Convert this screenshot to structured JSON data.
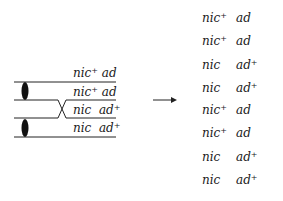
{
  "diagram": {
    "left": {
      "chromatids": [
        {
          "nic": "nic",
          "nic_sup": "+",
          "ad": "ad",
          "ad_sup": ""
        },
        {
          "nic": "nic",
          "nic_sup": "+",
          "ad": "ad",
          "ad_sup": ""
        },
        {
          "nic": "nic",
          "nic_sup": "",
          "ad": "ad",
          "ad_sup": "+"
        },
        {
          "nic": "nic",
          "nic_sup": "",
          "ad": "ad",
          "ad_sup": "+"
        }
      ],
      "crossover": "between chromatid 2 and 3"
    },
    "arrow": "right-arrow",
    "right": {
      "products": [
        {
          "nic": "nic",
          "nic_sup": "+",
          "ad": "ad",
          "ad_sup": ""
        },
        {
          "nic": "nic",
          "nic_sup": "+",
          "ad": "ad",
          "ad_sup": ""
        },
        {
          "nic": "nic",
          "nic_sup": "",
          "ad": "ad",
          "ad_sup": "+"
        },
        {
          "nic": "nic",
          "nic_sup": "",
          "ad": "ad",
          "ad_sup": "+"
        },
        {
          "nic": "nic",
          "nic_sup": "+",
          "ad": "ad",
          "ad_sup": ""
        },
        {
          "nic": "nic",
          "nic_sup": "+",
          "ad": "ad",
          "ad_sup": ""
        },
        {
          "nic": "nic",
          "nic_sup": "",
          "ad": "ad",
          "ad_sup": "+"
        },
        {
          "nic": "nic",
          "nic_sup": "",
          "ad": "ad",
          "ad_sup": "+"
        }
      ]
    }
  }
}
